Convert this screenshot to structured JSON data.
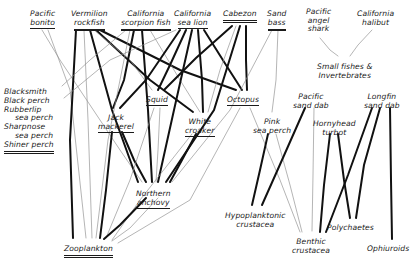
{
  "diagram": {
    "style": {
      "background": "#ffffff",
      "ink": "#1a1a1a",
      "thick_link": "#111111",
      "thin_link": "#8c8c8c"
    },
    "nodes": [
      {
        "id": "pacific_bonito",
        "label": "Pacific bonito",
        "lines": [
          "Pacific",
          "bonito"
        ],
        "underline": [
          0,
          1
        ],
        "x": 42,
        "y": 10,
        "align": "center"
      },
      {
        "id": "vermilion_rockfish",
        "label": "Vermilion rockfish",
        "lines": [
          "Vermilion",
          "rockfish"
        ],
        "underline": [
          0,
          2
        ],
        "x": 89,
        "y": 10,
        "align": "center"
      },
      {
        "id": "california_scorpion_fish",
        "label": "California scorpion fish",
        "lines": [
          "California",
          "scorpion fish"
        ],
        "underline": [
          0,
          2
        ],
        "x": 146,
        "y": 10,
        "align": "center"
      },
      {
        "id": "california_sea_lion",
        "label": "California sea lion",
        "lines": [
          "California",
          "sea lion"
        ],
        "underline": [
          0,
          1
        ],
        "x": 192,
        "y": 10,
        "align": "center"
      },
      {
        "id": "cabezon",
        "label": "Cabezon",
        "lines": [
          "Cabezon"
        ],
        "underline": [
          2
        ],
        "x": 240,
        "y": 10,
        "align": "center"
      },
      {
        "id": "sand_bass",
        "label": "Sand bass",
        "lines": [
          "Sand",
          "bass"
        ],
        "underline": [
          0,
          2
        ],
        "x": 277,
        "y": 10,
        "align": "center"
      },
      {
        "id": "pacific_angel_shark",
        "label": "Pacific angel shark",
        "lines": [
          "Pacific",
          "angel",
          "shark"
        ],
        "underline": [
          0,
          0,
          0
        ],
        "x": 318,
        "y": 8,
        "align": "center"
      },
      {
        "id": "california_halibut",
        "label": "California halibut",
        "lines": [
          "California",
          "halibut"
        ],
        "underline": [
          0,
          0
        ],
        "x": 375,
        "y": 10,
        "align": "center"
      },
      {
        "id": "small_fishes_invertebrates",
        "label": "Small fishes & Invertebrates",
        "lines": [
          "Small fishes &",
          "Invertebrates"
        ],
        "underline": [
          0,
          0
        ],
        "x": 344,
        "y": 63,
        "align": "center"
      },
      {
        "id": "perch_group",
        "label": "Blacksmith / Black perch / Rubberlip sea perch / Sharpnose sea perch / Shiner perch",
        "lines": [
          "Blacksmith",
          "Black perch",
          "Rubberlip",
          "sea perch",
          "Sharpnose",
          "sea perch",
          "Shiner perch"
        ],
        "underline": [
          0,
          0,
          0,
          0,
          0,
          0,
          2
        ],
        "x": 4,
        "y": 88,
        "align": "left"
      },
      {
        "id": "jack_mackerel",
        "label": "Jack mackerel",
        "lines": [
          "Jack",
          "mackerel"
        ],
        "underline": [
          0,
          1
        ],
        "x": 116,
        "y": 114,
        "align": "center"
      },
      {
        "id": "squid",
        "label": "Squid",
        "lines": [
          "Squid"
        ],
        "underline": [
          1
        ],
        "x": 157,
        "y": 96,
        "align": "center"
      },
      {
        "id": "white_croaker",
        "label": "White croaker",
        "lines": [
          "White",
          "croaker"
        ],
        "underline": [
          0,
          1
        ],
        "x": 200,
        "y": 118,
        "align": "center"
      },
      {
        "id": "octopus",
        "label": "Octopus",
        "lines": [
          "Octopus"
        ],
        "underline": [
          1
        ],
        "x": 243,
        "y": 96,
        "align": "center"
      },
      {
        "id": "pink_sea_perch",
        "label": "Pink sea perch",
        "lines": [
          "Pink",
          "sea perch"
        ],
        "underline": [
          0,
          0
        ],
        "x": 272,
        "y": 118,
        "align": "center"
      },
      {
        "id": "pacific_sand_dab",
        "label": "Pacific sand dab",
        "lines": [
          "Pacific",
          "sand dab"
        ],
        "underline": [
          0,
          0
        ],
        "x": 311,
        "y": 93,
        "align": "center"
      },
      {
        "id": "hornyhead_turbot",
        "label": "Hornyhead turbot",
        "lines": [
          "Hornyhead",
          "turbot"
        ],
        "underline": [
          0,
          0
        ],
        "x": 334,
        "y": 120,
        "align": "center"
      },
      {
        "id": "longfin_sand_dab",
        "label": "Longfin sand dab",
        "lines": [
          "Longfin",
          "sand dab"
        ],
        "underline": [
          0,
          0
        ],
        "x": 382,
        "y": 93,
        "align": "center"
      },
      {
        "id": "northern_anchovy",
        "label": "Northern anchovy",
        "lines": [
          "Northern",
          "anchovy"
        ],
        "underline": [
          0,
          1
        ],
        "x": 153,
        "y": 190,
        "align": "center"
      },
      {
        "id": "hypoplanktonic_crustacea",
        "label": "Hypoplanktonic crustacea",
        "lines": [
          "Hypoplanktonic",
          "crustacea"
        ],
        "underline": [
          0,
          0
        ],
        "x": 255,
        "y": 212,
        "align": "center"
      },
      {
        "id": "benthic_crustacea",
        "label": "Benthic crustacea",
        "lines": [
          "Benthic",
          "crustacea"
        ],
        "underline": [
          0,
          0
        ],
        "x": 311,
        "y": 238,
        "align": "center"
      },
      {
        "id": "polychaetes",
        "label": "Polychaetes",
        "lines": [
          "Polychaetes"
        ],
        "underline": [
          0
        ],
        "x": 350,
        "y": 224,
        "align": "center"
      },
      {
        "id": "ophiuroids",
        "label": "Ophiuroids",
        "lines": [
          "Ophiuroids"
        ],
        "underline": [
          0
        ],
        "x": 388,
        "y": 245,
        "align": "center"
      },
      {
        "id": "zooplankton",
        "label": "Zooplankton",
        "lines": [
          "Zooplankton"
        ],
        "underline": [
          2
        ],
        "x": 88,
        "y": 245,
        "align": "center"
      }
    ],
    "links": [
      {
        "from": "pacific_bonito",
        "to": "northern_anchovy",
        "weight": "thin",
        "path": "M 42 30 L 60 60 L 120 150 L 142 182"
      },
      {
        "from": "pacific_bonito",
        "to": "zooplankton",
        "weight": "thin",
        "path": "M 48 30 L 70 90 L 86 238"
      },
      {
        "from": "vermilion_rockfish",
        "to": "zooplankton",
        "weight": "thick",
        "path": "M 76 30 L 70 140 L 73 238"
      },
      {
        "from": "vermilion_rockfish",
        "to": "zooplankton",
        "weight": "thin",
        "path": "M 84 30 L 88 120 L 92 238"
      },
      {
        "from": "vermilion_rockfish",
        "to": "northern_anchovy",
        "weight": "thick",
        "path": "M 90 30 L 112 110 L 138 182"
      },
      {
        "from": "vermilion_rockfish",
        "to": "white_croaker",
        "weight": "thick",
        "path": "M 96 30 L 150 80 L 193 112"
      },
      {
        "from": "vermilion_rockfish",
        "to": "octopus",
        "weight": "thick",
        "path": "M 100 30 L 180 70 L 236 90"
      },
      {
        "from": "vermilion_rockfish",
        "to": "squid",
        "weight": "thin",
        "path": "M 94 30 L 130 60 L 152 90"
      },
      {
        "from": "california_scorpion_fish",
        "to": "jack_mackerel",
        "weight": "thick",
        "path": "M 134 30 L 124 80 L 113 108"
      },
      {
        "from": "california_scorpion_fish",
        "to": "northern_anchovy",
        "weight": "thick",
        "path": "M 142 30 L 148 110 L 152 182"
      },
      {
        "from": "california_scorpion_fish",
        "to": "zooplankton",
        "weight": "thin",
        "path": "M 130 30 L 108 140 L 96 238"
      },
      {
        "from": "california_scorpion_fish",
        "to": "white_croaker",
        "weight": "thin",
        "path": "M 150 30 L 180 80 L 200 112"
      },
      {
        "from": "california_scorpion_fish",
        "to": "perch_group",
        "weight": "thin",
        "path": "M 126 30 L 90 60 L 62 86"
      },
      {
        "from": "california_sea_lion",
        "to": "jack_mackerel",
        "weight": "thick",
        "path": "M 180 30 L 146 80 L 120 108"
      },
      {
        "from": "california_sea_lion",
        "to": "squid",
        "weight": "thick",
        "path": "M 186 30 L 170 65 L 158 90"
      },
      {
        "from": "california_sea_lion",
        "to": "northern_anchovy",
        "weight": "thick",
        "path": "M 192 30 L 174 110 L 158 182"
      },
      {
        "from": "california_sea_lion",
        "to": "white_croaker",
        "weight": "thick",
        "path": "M 198 30 L 202 80 L 203 112"
      },
      {
        "from": "california_sea_lion",
        "to": "octopus",
        "weight": "thick",
        "path": "M 204 30 L 226 65 L 242 90"
      },
      {
        "from": "california_sea_lion",
        "to": "perch_group",
        "weight": "thin",
        "path": "M 176 30 L 110 60 L 64 98"
      },
      {
        "from": "cabezon",
        "to": "squid",
        "weight": "thick",
        "path": "M 232 26 L 196 58 L 164 90"
      },
      {
        "from": "cabezon",
        "to": "northern_anchovy",
        "weight": "thick",
        "path": "M 240 26 L 214 110 L 166 182"
      },
      {
        "from": "cabezon",
        "to": "octopus",
        "weight": "thick",
        "path": "M 246 26 L 246 60 L 247 90"
      },
      {
        "from": "cabezon",
        "to": "white_croaker",
        "weight": "thin",
        "path": "M 236 26 L 220 70 L 208 112"
      },
      {
        "from": "sand_bass",
        "to": "northern_anchovy",
        "weight": "thin",
        "path": "M 272 30 L 230 110 L 172 182"
      },
      {
        "from": "sand_bass",
        "to": "pink_sea_perch",
        "weight": "thin",
        "path": "M 278 30 L 276 80 L 272 112"
      },
      {
        "from": "pacific_angel_shark",
        "to": "small_fishes_invertebrates",
        "weight": "thin",
        "path": "M 320 38 L 330 50 L 338 56"
      },
      {
        "from": "california_halibut",
        "to": "small_fishes_invertebrates",
        "weight": "thin",
        "path": "M 372 30 L 358 45 L 350 56"
      },
      {
        "from": "jack_mackerel",
        "to": "zooplankton",
        "weight": "thick",
        "path": "M 112 132 L 106 190 L 100 238"
      },
      {
        "from": "jack_mackerel",
        "to": "northern_anchovy",
        "weight": "thick",
        "path": "M 122 132 L 134 160 L 146 182"
      },
      {
        "from": "squid",
        "to": "zooplankton",
        "weight": "thin",
        "path": "M 154 108 L 130 180 L 106 238"
      },
      {
        "from": "squid",
        "to": "northern_anchovy",
        "weight": "thin",
        "path": "M 160 108 L 158 150 L 156 182"
      },
      {
        "from": "white_croaker",
        "to": "northern_anchovy",
        "weight": "thick",
        "path": "M 196 134 L 182 160 L 170 182"
      },
      {
        "from": "white_croaker",
        "to": "zooplankton",
        "weight": "thin",
        "path": "M 192 134 L 140 200 L 112 240"
      },
      {
        "from": "octopus",
        "to": "zooplankton",
        "weight": "thin",
        "path": "M 240 108 L 190 200 L 118 243"
      },
      {
        "from": "octopus",
        "to": "benthic_crustacea",
        "weight": "thin",
        "path": "M 250 108 L 280 180 L 300 232"
      },
      {
        "from": "pink_sea_perch",
        "to": "hypoplanktonic_crustacea",
        "weight": "thick",
        "path": "M 268 134 L 260 170 L 252 205"
      },
      {
        "from": "pink_sea_perch",
        "to": "benthic_crustacea",
        "weight": "thin",
        "path": "M 276 134 L 290 185 L 302 232"
      },
      {
        "from": "pacific_sand_dab",
        "to": "hypoplanktonic_crustacea",
        "weight": "thick",
        "path": "M 305 108 L 282 160 L 262 205"
      },
      {
        "from": "pacific_sand_dab",
        "to": "benthic_crustacea",
        "weight": "thin",
        "path": "M 314 108 L 313 175 L 312 231"
      },
      {
        "from": "hornyhead_turbot",
        "to": "benthic_crustacea",
        "weight": "thick",
        "path": "M 330 134 L 324 185 L 320 232"
      },
      {
        "from": "hornyhead_turbot",
        "to": "polychaetes",
        "weight": "thick",
        "path": "M 338 134 L 344 180 L 350 218"
      },
      {
        "from": "longfin_sand_dab",
        "to": "benthic_crustacea",
        "weight": "thick",
        "path": "M 372 108 L 348 175 L 326 232"
      },
      {
        "from": "longfin_sand_dab",
        "to": "polychaetes",
        "weight": "thick",
        "path": "M 380 108 L 364 165 L 356 218"
      },
      {
        "from": "longfin_sand_dab",
        "to": "ophiuroids",
        "weight": "thick",
        "path": "M 390 108 L 391 180 L 392 239"
      },
      {
        "from": "northern_anchovy",
        "to": "zooplankton",
        "weight": "thick",
        "path": "M 146 198 L 120 225 L 104 239"
      },
      {
        "from": "northern_anchovy",
        "to": "zooplankton",
        "weight": "thin",
        "path": "M 158 198 L 130 228 L 112 241"
      }
    ]
  }
}
